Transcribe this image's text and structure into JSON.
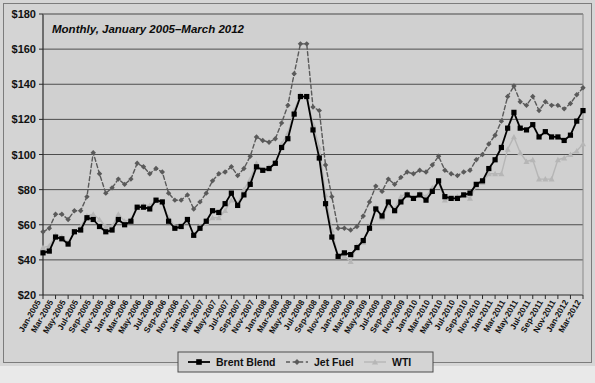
{
  "chart_data": {
    "type": "line",
    "title": "Monthly, January 2005–March 2012",
    "xlabel": "",
    "ylabel": "",
    "ylim": [
      20,
      180
    ],
    "ytick_values": [
      20,
      40,
      60,
      80,
      100,
      120,
      140,
      160,
      180
    ],
    "ytick_labels": [
      "$20",
      "$40",
      "$60",
      "$80",
      "$100",
      "$120",
      "$140",
      "$160",
      "$180"
    ],
    "grid": true,
    "legend_position": "bottom-center",
    "legend": [
      "Brent Blend",
      "Jet Fuel",
      "WTI"
    ],
    "x_tick_every": 2,
    "categories": [
      "Jan-2005",
      "Feb-2005",
      "Mar-2005",
      "Apr-2005",
      "May-2005",
      "Jun-2005",
      "Jul-2005",
      "Aug-2005",
      "Sep-2005",
      "Oct-2005",
      "Nov-2005",
      "Dec-2005",
      "Jan-2006",
      "Feb-2006",
      "Mar-2006",
      "Apr-2006",
      "May-2006",
      "Jun-2006",
      "Jul-2006",
      "Aug-2006",
      "Sep-2006",
      "Oct-2006",
      "Nov-2006",
      "Dec-2006",
      "Jan-2007",
      "Feb-2007",
      "Mar-2007",
      "Apr-2007",
      "May-2007",
      "Jun-2007",
      "Jul-2007",
      "Aug-2007",
      "Sep-2007",
      "Oct-2007",
      "Nov-2007",
      "Dec-2007",
      "Jan-2008",
      "Feb-2008",
      "Mar-2008",
      "Apr-2008",
      "May-2008",
      "Jun-2008",
      "Jul-2008",
      "Aug-2008",
      "Sep-2008",
      "Oct-2008",
      "Nov-2008",
      "Dec-2008",
      "Jan-2009",
      "Feb-2009",
      "Mar-2009",
      "Apr-2009",
      "May-2009",
      "Jun-2009",
      "Jul-2009",
      "Aug-2009",
      "Sep-2009",
      "Oct-2009",
      "Nov-2009",
      "Dec-2009",
      "Jan-2010",
      "Feb-2010",
      "Mar-2010",
      "Apr-2010",
      "May-2010",
      "Jun-2010",
      "Jul-2010",
      "Aug-2010",
      "Sep-2010",
      "Oct-2010",
      "Nov-2010",
      "Dec-2010",
      "Jan-2011",
      "Feb-2011",
      "Mar-2011",
      "Apr-2011",
      "May-2011",
      "Jun-2011",
      "Jul-2011",
      "Aug-2011",
      "Sep-2011",
      "Oct-2011",
      "Nov-2011",
      "Dec-2011",
      "Jan-2012",
      "Feb-2012",
      "Mar-2012"
    ],
    "xtick_labels": [
      "Jan-2005",
      "Mar-2005",
      "May-2005",
      "Jul-2005",
      "Sep-2005",
      "Nov-2005",
      "Jan-2006",
      "Mar-2006",
      "May-2006",
      "Jul-2006",
      "Sep-2006",
      "Nov-2006",
      "Jan-2007",
      "Mar-2007",
      "May-2007",
      "Jul-2007",
      "Sep-2007",
      "Nov-2007",
      "Jan-2008",
      "Mar-2008",
      "May-2008",
      "Jul-2008",
      "Sep-2008",
      "Nov-2008",
      "Jan-2009",
      "Mar-2009",
      "May-2009",
      "Jul-2009",
      "Sep-2009",
      "Nov-2009",
      "Jan-2010",
      "Mar-2010",
      "May-2010",
      "Jul-2010",
      "Sep-2010",
      "Nov-2010",
      "Jan-2011",
      "Mar-2011",
      "May-2011",
      "Jul-2011",
      "Sep-2011",
      "Nov-2011",
      "Jan-2012",
      "Mar-2012"
    ],
    "series": [
      {
        "name": "Brent Blend",
        "color": "#000000",
        "marker": "square",
        "dash": "solid",
        "values": [
          44,
          45,
          53,
          52,
          49,
          56,
          57,
          64,
          63,
          59,
          56,
          57,
          63,
          60,
          62,
          70,
          70,
          69,
          74,
          73,
          62,
          58,
          59,
          63,
          54,
          58,
          62,
          68,
          67,
          72,
          78,
          71,
          77,
          83,
          93,
          91,
          92,
          95,
          104,
          109,
          123,
          133,
          133,
          114,
          98,
          72,
          53,
          42,
          44,
          43,
          47,
          51,
          58,
          69,
          65,
          73,
          68,
          73,
          77,
          75,
          77,
          74,
          79,
          85,
          76,
          75,
          75,
          77,
          78,
          83,
          85,
          92,
          97,
          104,
          115,
          124,
          115,
          114,
          117,
          110,
          113,
          110,
          110,
          108,
          111,
          119,
          125
        ]
      },
      {
        "name": "Jet Fuel",
        "color": "#5a5a5a",
        "marker": "diamond",
        "dash": "dashed",
        "values": [
          56,
          58,
          66,
          66,
          63,
          68,
          68,
          76,
          101,
          89,
          78,
          81,
          86,
          83,
          86,
          95,
          93,
          89,
          92,
          90,
          78,
          74,
          74,
          77,
          69,
          73,
          78,
          85,
          89,
          90,
          93,
          88,
          92,
          99,
          110,
          108,
          107,
          109,
          118,
          128,
          146,
          163,
          163,
          127,
          125,
          94,
          76,
          58,
          58,
          57,
          59,
          65,
          73,
          82,
          79,
          86,
          83,
          87,
          90,
          89,
          91,
          90,
          94,
          99,
          91,
          89,
          88,
          90,
          91,
          97,
          100,
          106,
          111,
          119,
          133,
          139,
          130,
          128,
          133,
          125,
          130,
          128,
          128,
          126,
          129,
          134,
          138
        ]
      },
      {
        "name": "WTI",
        "color": "#b6b6b6",
        "marker": "triangle",
        "dash": "solid",
        "values": [
          47,
          48,
          54,
          53,
          50,
          56,
          59,
          65,
          66,
          63,
          59,
          59,
          66,
          62,
          63,
          70,
          71,
          71,
          74,
          73,
          64,
          59,
          59,
          62,
          54,
          59,
          61,
          64,
          64,
          68,
          74,
          72,
          80,
          86,
          95,
          91,
          93,
          95,
          106,
          112,
          125,
          134,
          133,
          117,
          104,
          77,
          57,
          42,
          42,
          39,
          48,
          50,
          59,
          70,
          64,
          71,
          69,
          76,
          78,
          75,
          78,
          76,
          81,
          84,
          74,
          75,
          76,
          77,
          75,
          82,
          84,
          89,
          89,
          89,
          103,
          110,
          101,
          96,
          97,
          86,
          86,
          86,
          97,
          98,
          100,
          102,
          106
        ]
      }
    ]
  },
  "legend": {
    "items": [
      {
        "label": "Brent Blend"
      },
      {
        "label": "Jet Fuel"
      },
      {
        "label": "WTI"
      }
    ]
  }
}
